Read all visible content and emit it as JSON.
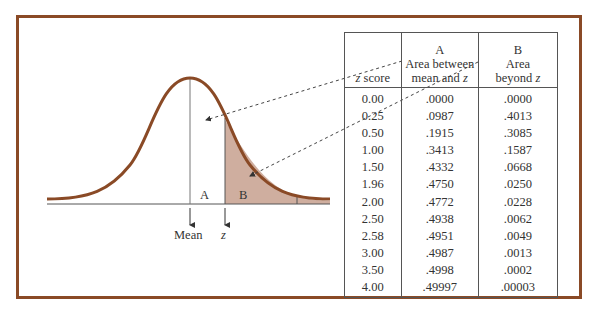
{
  "figure": {
    "labels": {
      "region_a": "A",
      "region_b": "B",
      "mean": "Mean",
      "z": "z"
    },
    "colors": {
      "curve": "#8a4a26",
      "shade": "#cfae9f",
      "frame": "#8a4a26",
      "axis": "#555555"
    }
  },
  "table": {
    "headers": {
      "col1": {
        "line3": "z score"
      },
      "col2": {
        "line1": "A",
        "line2": "Area between",
        "line3": "mean and z"
      },
      "col3": {
        "line1": "B",
        "line2": "Area",
        "line3": "beyond z"
      }
    },
    "rows": [
      {
        "z": "0.00",
        "a": ".0000",
        "b": ".0000"
      },
      {
        "z": "0.25",
        "a": ".0987",
        "b": ".4013"
      },
      {
        "z": "0.50",
        "a": ".1915",
        "b": ".3085"
      },
      {
        "z": "1.00",
        "a": ".3413",
        "b": ".1587"
      },
      {
        "z": "1.50",
        "a": ".4332",
        "b": ".0668"
      },
      {
        "z": "1.96",
        "a": ".4750",
        "b": ".0250"
      },
      {
        "z": "2.00",
        "a": ".4772",
        "b": ".0228"
      },
      {
        "z": "2.50",
        "a": ".4938",
        "b": ".0062"
      },
      {
        "z": "2.58",
        "a": ".4951",
        "b": ".0049"
      },
      {
        "z": "3.00",
        "a": ".4987",
        "b": ".0013"
      },
      {
        "z": "3.50",
        "a": ".4998",
        "b": ".0002"
      },
      {
        "z": "4.00",
        "a": ".49997",
        "b": ".00003"
      }
    ]
  }
}
